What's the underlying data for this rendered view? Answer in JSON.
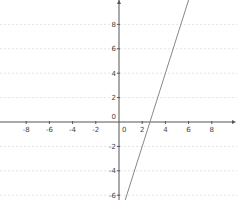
{
  "chart_data": {
    "type": "line",
    "title": "",
    "xlabel": "",
    "ylabel": "",
    "xlim": [
      -10.2,
      10.2
    ],
    "ylim": [
      -6.5,
      10
    ],
    "grid": true,
    "x_ticks": [
      -8,
      -6,
      -4,
      -2,
      0,
      2,
      4,
      6,
      8
    ],
    "y_ticks": [
      -6,
      -4,
      -2,
      0,
      2,
      4,
      6,
      8
    ],
    "x_tick_labels": [
      "-8",
      "-6",
      "-4",
      "-2",
      "0",
      "2",
      "4",
      "6",
      "8"
    ],
    "y_tick_labels": [
      "-6",
      "-4",
      "-2",
      "0",
      "2",
      "4",
      "6",
      "8"
    ],
    "series": [
      {
        "name": "y = 3x - 8",
        "equation": "y = 3x - 8",
        "slope": 3,
        "intercept": -8,
        "x": [
          0.5,
          6
        ],
        "y": [
          -6.5,
          10
        ],
        "color": "#888888"
      }
    ]
  },
  "layout": {
    "origin_px": [
      119,
      122
    ],
    "px_per_unit_x": 11.6,
    "px_per_unit_y": 12.2,
    "axis_color": "#555555",
    "grid_color": "#e4e4e4",
    "line_color": "#8a8a8a"
  }
}
